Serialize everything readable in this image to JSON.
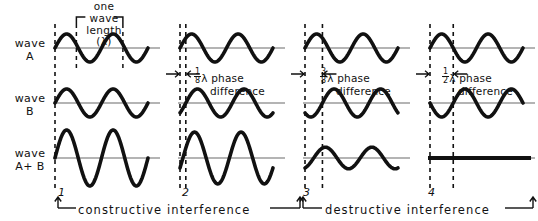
{
  "figure": {
    "wavelength_caption": "one\nwave\nlength\n(λ)",
    "row_labels": [
      {
        "id": "wave-a",
        "text": "wave\nA"
      },
      {
        "id": "wave-b",
        "text": "wave\nB"
      },
      {
        "id": "wave-a-plus-b",
        "text": "wave\nA+ B"
      }
    ],
    "panel_numbers": [
      "1",
      "2",
      "3",
      "4"
    ],
    "phase_captions": [
      {
        "panel": 1,
        "numerator": "",
        "denominator": "",
        "text": "",
        "visible": false
      },
      {
        "panel": 2,
        "numerator": "1",
        "denominator": "8",
        "lambda": "λ",
        "line1": " phase",
        "line2": "difference"
      },
      {
        "panel": 3,
        "numerator": "3",
        "denominator": "8",
        "lambda": "λ",
        "line1": " phase",
        "line2": "difference"
      },
      {
        "panel": 4,
        "numerator": "1",
        "denominator": "2",
        "lambda": "λ",
        "line1": " phase",
        "line2": "difference"
      }
    ],
    "bottom_captions": [
      {
        "id": "constructive",
        "text": "constructive  interference"
      },
      {
        "id": "destructive",
        "text": "destructive  interference"
      }
    ],
    "colors": {
      "ink": "#111111",
      "axis": "#6b6b6b",
      "background": "#ffffff"
    }
  },
  "chart_data": {
    "type": "line",
    "xlabel": "",
    "ylabel": "",
    "grid": false,
    "legend_position": "left-row-labels",
    "panels": [
      {
        "number": "1",
        "phase_difference_label": "",
        "phase_difference_fraction_of_lambda": 0,
        "interference": "constructive",
        "series": [
          {
            "name": "wave A",
            "amplitude": 1.0,
            "phase_shift_lambda": 0.0
          },
          {
            "name": "wave B",
            "amplitude": 1.0,
            "phase_shift_lambda": 0.0
          },
          {
            "name": "wave A+B",
            "amplitude": 2.0,
            "phase_shift_lambda": 0.0
          }
        ]
      },
      {
        "number": "2",
        "phase_difference_label": "1/8 λ phase difference",
        "phase_difference_fraction_of_lambda": 0.125,
        "interference": "constructive",
        "series": [
          {
            "name": "wave A",
            "amplitude": 1.0,
            "phase_shift_lambda": 0.0
          },
          {
            "name": "wave B",
            "amplitude": 1.0,
            "phase_shift_lambda": 0.125
          },
          {
            "name": "wave A+B",
            "amplitude": 1.85,
            "phase_shift_lambda": 0.0625
          }
        ]
      },
      {
        "number": "3",
        "phase_difference_label": "3/8 λ phase difference",
        "phase_difference_fraction_of_lambda": 0.375,
        "interference": "destructive",
        "series": [
          {
            "name": "wave A",
            "amplitude": 1.0,
            "phase_shift_lambda": 0.0
          },
          {
            "name": "wave B",
            "amplitude": 1.0,
            "phase_shift_lambda": 0.375
          },
          {
            "name": "wave A+B",
            "amplitude": 0.77,
            "phase_shift_lambda": 0.1875
          }
        ]
      },
      {
        "number": "4",
        "phase_difference_label": "1/2 λ phase difference",
        "phase_difference_fraction_of_lambda": 0.5,
        "interference": "destructive",
        "series": [
          {
            "name": "wave A",
            "amplitude": 1.0,
            "phase_shift_lambda": 0.0
          },
          {
            "name": "wave B",
            "amplitude": 1.0,
            "phase_shift_lambda": 0.5
          },
          {
            "name": "wave A+B",
            "amplitude": 0.0,
            "phase_shift_lambda": 0.0
          }
        ]
      }
    ]
  },
  "geometry": {
    "panels": [
      {
        "x0": 55,
        "x1": 148,
        "cycles": 2
      },
      {
        "x0": 180,
        "x1": 273,
        "cycles": 2
      },
      {
        "x0": 305,
        "x1": 398,
        "cycles": 2
      },
      {
        "x0": 430,
        "x1": 523,
        "cycles": 2
      }
    ],
    "row_baselines": {
      "a": 48,
      "b": 103,
      "ab": 158
    },
    "amplitude_px": 14,
    "amplitude_sum_px": 28
  }
}
